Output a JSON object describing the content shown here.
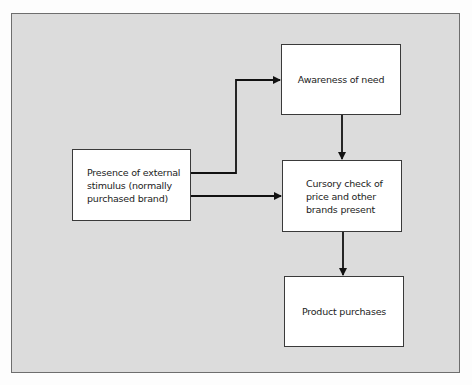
{
  "diagram": {
    "type": "flowchart",
    "background_color": "#dcdcdc",
    "box_color": "#ffffff",
    "line_color": "#111111",
    "nodes": [
      {
        "id": "stimulus",
        "label": "Presence of external\nstimulus (normally\npurchased brand)"
      },
      {
        "id": "awareness",
        "label": "Awareness of need"
      },
      {
        "id": "cursory_check",
        "label": "Cursory check of\nprice and other\nbrands present"
      },
      {
        "id": "purchase",
        "label": "Product purchases"
      }
    ],
    "edges": [
      {
        "from": "stimulus",
        "to": "awareness"
      },
      {
        "from": "stimulus",
        "to": "cursory_check"
      },
      {
        "from": "awareness",
        "to": "cursory_check"
      },
      {
        "from": "cursory_check",
        "to": "purchase"
      }
    ]
  }
}
